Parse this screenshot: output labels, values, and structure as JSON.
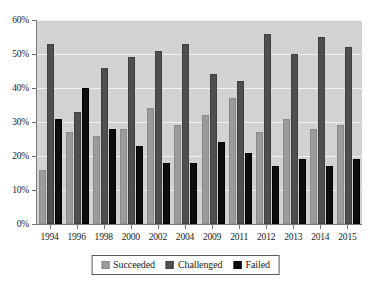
{
  "chart_data": {
    "type": "bar",
    "title": "",
    "subtitle": "",
    "xlabel": "",
    "ylabel": "",
    "categories": [
      "1994",
      "1996",
      "1998",
      "2000",
      "2002",
      "2004",
      "2009",
      "2011",
      "2012",
      "2013",
      "2014",
      "2015"
    ],
    "series": [
      {
        "name": "Succeeded",
        "color": "#9b9b9b",
        "values": [
          16,
          27,
          26,
          28,
          34,
          29,
          32,
          37,
          27,
          31,
          28,
          29
        ]
      },
      {
        "name": "Challenged",
        "color": "#4f4f4f",
        "values": [
          53,
          33,
          46,
          49,
          51,
          53,
          44,
          42,
          56,
          50,
          55,
          52
        ]
      },
      {
        "name": "Failed",
        "color": "#0d0d0d",
        "values": [
          31,
          40,
          28,
          23,
          18,
          18,
          24,
          21,
          17,
          19,
          17,
          19
        ]
      }
    ],
    "ylim": [
      0,
      60
    ],
    "ytick_values": [
      0,
      10,
      20,
      30,
      40,
      50,
      60
    ],
    "ytick_labels": [
      "0%",
      "10%",
      "20%",
      "30%",
      "40%",
      "50%",
      "60%"
    ],
    "grid": true,
    "legend_position": "bottom-center",
    "plot_background": "#d2d2d2",
    "gridline_color": "#f2f2f2"
  },
  "legend": {
    "items": [
      {
        "label": "Succeeded",
        "swatch": "succeeded"
      },
      {
        "label": "Challenged",
        "swatch": "challenged"
      },
      {
        "label": "Failed",
        "swatch": "failed"
      }
    ]
  }
}
